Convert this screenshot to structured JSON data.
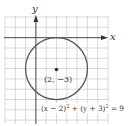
{
  "diagram": {
    "type": "circle-graph",
    "axis_labels": {
      "x": "x",
      "y": "y"
    },
    "center": {
      "x": 2,
      "y": -3
    },
    "radius": 3,
    "center_label": "(2, −3)",
    "equation": {
      "part1": "(x − 2)",
      "exp1": "2",
      "part2": " + (y + 3)",
      "exp2": "2",
      "part3": " = 9"
    },
    "colors": {
      "grid": "#c8c8c8",
      "axes": "#444444",
      "circle": "#555555",
      "point": "#333333"
    }
  }
}
